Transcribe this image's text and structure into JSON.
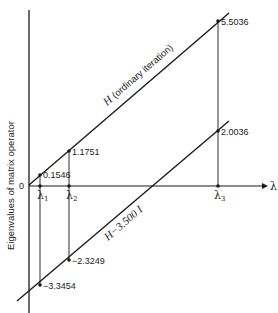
{
  "diagram": {
    "y_axis_label": "Eigenvalues of matrix operator",
    "x_axis_label": "λ",
    "origin_label": "0",
    "eigen_markers": [
      {
        "name": "λ",
        "sub": "1"
      },
      {
        "name": "λ",
        "sub": "2"
      },
      {
        "name": "λ",
        "sub": "3"
      }
    ],
    "upper_line": {
      "label_main": "H",
      "label_note": "(ordinary iteration)",
      "values": [
        "0.1546",
        "1.1751",
        "5.5036"
      ]
    },
    "lower_line": {
      "label_main": "H",
      "label_note": "−3.500 I",
      "values": [
        "−3.3454",
        "−2.3249",
        "2.0036"
      ]
    }
  }
}
